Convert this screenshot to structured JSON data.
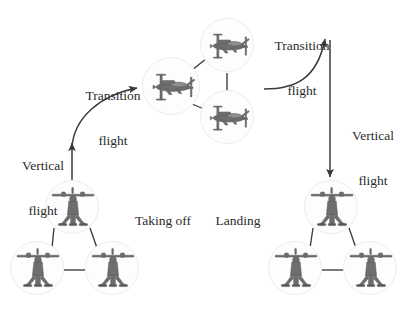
{
  "figure": {
    "type": "diagram",
    "background_color": "#ffffff",
    "line_color": "#3a3a3a",
    "text_color": "#2b2b2b",
    "node_fill_color": "#fdfdfd",
    "node_ring_color": "#ececec",
    "aircraft_body_color": "#6e6e6e"
  },
  "labels": {
    "transition_flight_left": {
      "line1": "Transition",
      "line2": "flight",
      "x": 112,
      "y": 58
    },
    "transition_flight_right": {
      "line1": "Transition",
      "line2": "flight",
      "x": 302,
      "y": 12
    },
    "vertical_flight_left": {
      "line1": "Vertical",
      "line2": "flight",
      "x": 42,
      "y": 128
    },
    "vertical_flight_right": {
      "line1": "Vertical",
      "line2": "flight",
      "x": 369,
      "y": 100
    },
    "taking_off": {
      "text": "Taking off",
      "x": 162,
      "y": 220
    },
    "landing": {
      "text": "Landing",
      "x": 240,
      "y": 220
    }
  },
  "clusters": [
    {
      "name": "hover-formation-takeoff",
      "mode": "vertical",
      "label": "Taking off",
      "nodes": [
        {
          "id": "tk-apex",
          "cx": 72,
          "cy": 207,
          "r": 27
        },
        {
          "id": "tk-left",
          "cx": 37,
          "cy": 268,
          "r": 27
        },
        {
          "id": "tk-right",
          "cx": 112,
          "cy": 268,
          "r": 27
        }
      ],
      "edges": [
        {
          "from": "tk-apex",
          "to": "tk-left"
        },
        {
          "from": "tk-apex",
          "to": "tk-right"
        },
        {
          "from": "tk-left",
          "to": "tk-right"
        }
      ]
    },
    {
      "name": "cruise-formation",
      "mode": "horizontal",
      "label": "Transition flight",
      "nodes": [
        {
          "id": "cr-left",
          "cx": 171,
          "cy": 86,
          "r": 29
        },
        {
          "id": "cr-top",
          "cx": 227,
          "cy": 45,
          "r": 27
        },
        {
          "id": "cr-bottom",
          "cx": 227,
          "cy": 117,
          "r": 27
        }
      ],
      "edges": [
        {
          "from": "cr-left",
          "to": "cr-top"
        },
        {
          "from": "cr-left",
          "to": "cr-bottom"
        },
        {
          "from": "cr-top",
          "to": "cr-bottom"
        }
      ]
    },
    {
      "name": "hover-formation-landing",
      "mode": "vertical",
      "label": "Landing",
      "nodes": [
        {
          "id": "ld-apex",
          "cx": 331,
          "cy": 207,
          "r": 27
        },
        {
          "id": "ld-left",
          "cx": 295,
          "cy": 268,
          "r": 27
        },
        {
          "id": "ld-right",
          "cx": 370,
          "cy": 268,
          "r": 27
        }
      ],
      "edges": [
        {
          "from": "ld-apex",
          "to": "ld-left"
        },
        {
          "from": "ld-apex",
          "to": "ld-right"
        },
        {
          "from": "ld-left",
          "to": "ld-right"
        }
      ]
    }
  ],
  "arrows": [
    {
      "name": "vertical-flight-ascent-arrow",
      "label": "Vertical flight",
      "kind": "straight",
      "direction": "up",
      "from": {
        "x": 72,
        "y": 180
      },
      "to": {
        "x": 72,
        "y": 142
      }
    },
    {
      "name": "transition-flight-climb-arrow",
      "label": "Transition flight",
      "kind": "curved",
      "direction": "up-right",
      "from": {
        "x": 73,
        "y": 142
      },
      "to": {
        "x": 141,
        "y": 87
      }
    },
    {
      "name": "transition-flight-descent-arrow",
      "label": "Transition flight",
      "kind": "curved",
      "direction": "right-up",
      "from": {
        "x": 265,
        "y": 88
      },
      "to": {
        "x": 325,
        "y": 35
      }
    },
    {
      "name": "vertical-flight-descent-arrow",
      "label": "Vertical flight",
      "kind": "straight",
      "direction": "down",
      "from": {
        "x": 330,
        "y": 40
      },
      "to": {
        "x": 330,
        "y": 178
      }
    }
  ]
}
